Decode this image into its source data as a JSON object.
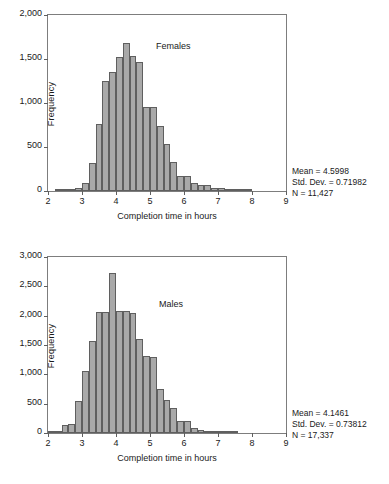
{
  "chart_data": [
    {
      "type": "bar",
      "id": "females-histogram",
      "title": "Females",
      "xlabel": "Completion time in hours",
      "ylabel": "Frequency",
      "xlim": [
        2,
        9
      ],
      "ylim": [
        0,
        2000
      ],
      "xticks": [
        "2",
        "3",
        "4",
        "5",
        "6",
        "7",
        "8",
        "9"
      ],
      "yticks": [
        "0",
        "500",
        "1,000",
        "1,500",
        "2,000"
      ],
      "grid": false,
      "bin_width": 0.2,
      "bin_starts": [
        2.2,
        2.4,
        2.6,
        2.8,
        3.0,
        3.2,
        3.4,
        3.6,
        3.8,
        4.0,
        4.2,
        4.4,
        4.6,
        4.8,
        5.0,
        5.2,
        5.4,
        5.6,
        5.8,
        6.0,
        6.2,
        6.4,
        6.6,
        6.8,
        7.0,
        7.2,
        7.4,
        7.6,
        7.8
      ],
      "values": [
        5,
        8,
        15,
        35,
        95,
        320,
        760,
        1250,
        1350,
        1520,
        1685,
        1535,
        1465,
        960,
        955,
        740,
        535,
        330,
        175,
        175,
        95,
        70,
        70,
        35,
        35,
        10,
        8,
        5,
        3
      ],
      "stats": {
        "mean_label": "Mean = 4.5998",
        "std_label": "Std. Dev. = 0.71982",
        "n_label": "N = 11,427",
        "mean": 4.5998,
        "std_dev": 0.71982,
        "n": 11427
      }
    },
    {
      "type": "bar",
      "id": "males-histogram",
      "title": "Males",
      "xlabel": "Completion time in hours",
      "ylabel": "Frequency",
      "xlim": [
        2,
        9
      ],
      "ylim": [
        0,
        3000
      ],
      "xticks": [
        "2",
        "3",
        "4",
        "5",
        "6",
        "7",
        "8",
        "9"
      ],
      "yticks": [
        "0",
        "500",
        "1,000",
        "1,500",
        "2,000",
        "2,500",
        "3,000"
      ],
      "grid": false,
      "bin_width": 0.2,
      "bin_starts": [
        2.0,
        2.2,
        2.4,
        2.6,
        2.8,
        3.0,
        3.2,
        3.4,
        3.6,
        3.8,
        4.0,
        4.2,
        4.4,
        4.6,
        4.8,
        5.0,
        5.2,
        5.4,
        5.6,
        5.8,
        6.0,
        6.2,
        6.4,
        6.6,
        6.8,
        7.0,
        7.2,
        7.4
      ],
      "values": [
        10,
        30,
        145,
        150,
        545,
        1050,
        1560,
        2065,
        2065,
        2735,
        2085,
        2085,
        2050,
        1595,
        1305,
        1300,
        750,
        570,
        420,
        205,
        205,
        85,
        55,
        40,
        20,
        10,
        6,
        4
      ],
      "stats": {
        "mean_label": "Mean = 4.1461",
        "std_label": "Std. Dev. = 0.73812",
        "n_label": "N = 17,337",
        "mean": 4.1461,
        "std_dev": 0.73812,
        "n": 17337
      }
    }
  ],
  "style": {
    "bar_fill": "#a9a9a9",
    "bar_stroke": "#5f5f5f",
    "frame_stroke": "#7d7d7d",
    "text_color": "#1a1a1a",
    "background": "#ffffff"
  }
}
